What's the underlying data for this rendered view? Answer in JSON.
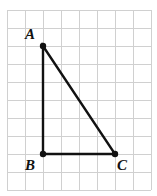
{
  "figure": {
    "type": "geometry-diagram",
    "background_color": "#ffffff",
    "grid": {
      "line_color": "#d0d0d0",
      "line_width": 1,
      "cell_size": 18,
      "origin_x": 7,
      "origin_y": 10,
      "columns": 8,
      "rows": 10,
      "visible": true
    },
    "shape": {
      "name": "triangle-ABC",
      "stroke_color": "#111111",
      "stroke_width": 2.4,
      "fill": "none",
      "vertex_dot_color": "#111111",
      "vertex_dot_radius": 3.2,
      "vertices": [
        {
          "label": "A",
          "x": 43,
          "y": 46,
          "grid_x": 2,
          "grid_y": 2,
          "label_dx": -13,
          "label_dy": -7
        },
        {
          "label": "B",
          "x": 43,
          "y": 154,
          "grid_x": 2,
          "grid_y": 8,
          "label_dx": -13,
          "label_dy": 16
        },
        {
          "label": "C",
          "x": 115,
          "y": 154,
          "grid_x": 6,
          "grid_y": 8,
          "label_dx": 7,
          "label_dy": 16
        }
      ],
      "edges": [
        {
          "name": "AB",
          "from": "A",
          "to": "B"
        },
        {
          "name": "BC",
          "from": "B",
          "to": "C"
        },
        {
          "name": "CA",
          "from": "C",
          "to": "A"
        }
      ]
    }
  },
  "chart_data": {
    "type": "scatter",
    "title": "",
    "xlabel": "",
    "ylabel": "",
    "grid": true,
    "legend": "none",
    "categories": [
      "A",
      "B",
      "C"
    ],
    "points": [
      {
        "label": "A",
        "x": 2,
        "y": 8
      },
      {
        "label": "B",
        "x": 2,
        "y": 2
      },
      {
        "label": "C",
        "x": 6,
        "y": 2
      }
    ],
    "xlim": [
      0,
      8
    ],
    "ylim": [
      0,
      10
    ]
  }
}
